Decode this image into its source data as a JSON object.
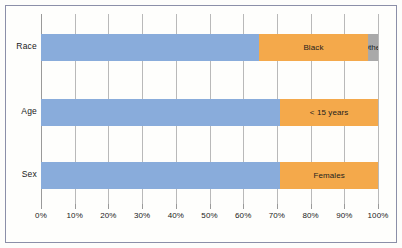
{
  "chart_data": {
    "type": "bar",
    "orientation": "horizontal",
    "stacked": true,
    "normalized_percent": true,
    "title": "",
    "subtitle": "",
    "xlabel": "",
    "ylabel": "",
    "xlim": [
      0,
      100
    ],
    "grid": true,
    "legend_position": "none",
    "categories": [
      "Race",
      "Age",
      "Sex"
    ],
    "tick_labels": [
      "0%",
      "10%",
      "20%",
      "30%",
      "40%",
      "50%",
      "60%",
      "70%",
      "80%",
      "90%",
      "100%"
    ],
    "tick_values": [
      0,
      10,
      20,
      30,
      40,
      50,
      60,
      70,
      80,
      90,
      100
    ],
    "colors": {
      "primary": "#89acdb",
      "secondary": "#f4a94b",
      "tertiary": "#a9a9a9",
      "gridline": "#b9b9b9",
      "border": "#8b8fa8",
      "background": "#fefefc",
      "text": "#1a1a1a"
    },
    "rows": [
      {
        "category": "Race",
        "segments": [
          {
            "label": "",
            "value": 64.7,
            "color": "#89acdb",
            "show_label": false
          },
          {
            "label": "Black",
            "value": 32.3,
            "color": "#f4a94b",
            "show_label": true
          },
          {
            "label": "Other",
            "value": 3.0,
            "color": "#a9a9a9",
            "show_label": true
          }
        ]
      },
      {
        "category": "Age",
        "segments": [
          {
            "label": "",
            "value": 71.0,
            "color": "#89acdb",
            "show_label": false
          },
          {
            "label": "< 15 years",
            "value": 29.0,
            "color": "#f4a94b",
            "show_label": true
          }
        ]
      },
      {
        "category": "Sex",
        "segments": [
          {
            "label": "",
            "value": 71.0,
            "color": "#89acdb",
            "show_label": false
          },
          {
            "label": "Females",
            "value": 29.0,
            "color": "#f4a94b",
            "show_label": true
          }
        ]
      }
    ]
  }
}
